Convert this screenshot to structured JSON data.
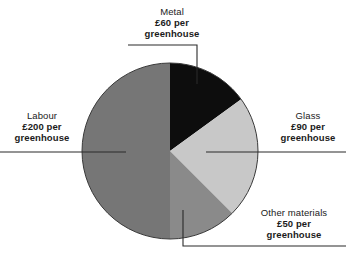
{
  "chart_data": {
    "type": "pie",
    "title": "",
    "unit_label": "per greenhouse",
    "currency": "£",
    "total": 400,
    "categories": [
      "Metal",
      "Glass",
      "Other materials",
      "Labour"
    ],
    "values": [
      60,
      90,
      50,
      200
    ],
    "colors": [
      "#0d0d0d",
      "#c8c8c8",
      "#8a8a8a",
      "#767676"
    ],
    "legend": "none",
    "grid": false,
    "slices": [
      {
        "name": "Metal",
        "value": 60,
        "amount_text": "£60 per",
        "unit_text": "greenhouse",
        "color": "#0d0d0d",
        "start_angle_deg": 0,
        "end_angle_deg": 54
      },
      {
        "name": "Glass",
        "value": 90,
        "amount_text": "£90 per",
        "unit_text": "greenhouse",
        "color": "#c8c8c8",
        "start_angle_deg": 54,
        "end_angle_deg": 135
      },
      {
        "name": "Other materials",
        "value": 50,
        "amount_text": "£50 per",
        "unit_text": "greenhouse",
        "color": "#8a8a8a",
        "start_angle_deg": 135,
        "end_angle_deg": 180
      },
      {
        "name": "Labour",
        "value": 200,
        "amount_text": "£200 per",
        "unit_text": "greenhouse",
        "color": "#767676",
        "start_angle_deg": 180,
        "end_angle_deg": 360
      }
    ]
  },
  "labels": {
    "metal": {
      "category": "Metal",
      "amount": "£60 per",
      "unit": "greenhouse"
    },
    "glass": {
      "category": "Glass",
      "amount": "£90 per",
      "unit": "greenhouse"
    },
    "labour": {
      "category": "Labour",
      "amount": "£200 per",
      "unit": "greenhouse"
    },
    "other": {
      "category": "Other materials",
      "amount": "£50 per",
      "unit": "greenhouse"
    }
  }
}
